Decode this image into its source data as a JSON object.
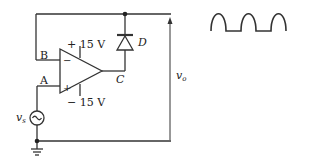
{
  "circuit": {
    "title": "Op-amp half-wave rectifier (precision rectifier)",
    "nodes": {
      "B": "B",
      "A": "A",
      "C": "C"
    },
    "supply": {
      "positive": "+ 15 V",
      "negative": "− 15 V"
    },
    "opamp": {
      "inverting": "−",
      "noninverting": "+"
    },
    "diode": {
      "label": "D"
    },
    "source": {
      "label": "v",
      "subscript": "s",
      "symbol": "~"
    },
    "output": {
      "label": "v",
      "subscript": "o"
    }
  },
  "waveform": {
    "description": "half-wave rectified output",
    "humps": 3
  },
  "colors": {
    "line": "#333333",
    "background": "#ffffff"
  }
}
